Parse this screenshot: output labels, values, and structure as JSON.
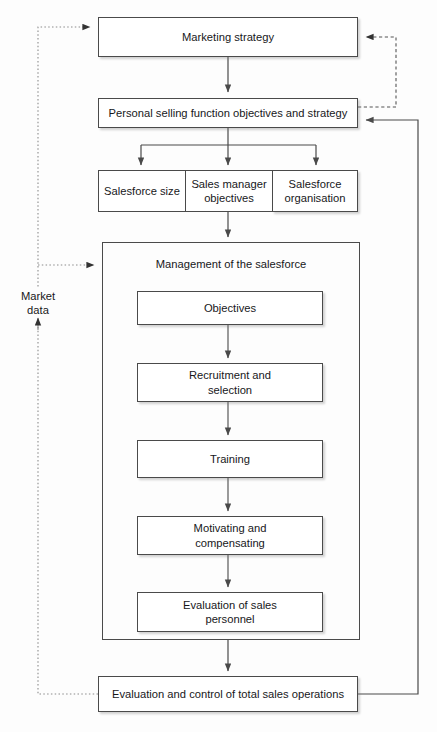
{
  "diagram": {
    "nodes": {
      "marketing_strategy": "Marketing strategy",
      "personal_selling": "Personal selling function objectives and strategy",
      "salesforce_size": "Salesforce size",
      "sales_manager_objectives": "Sales manager objectives",
      "salesforce_organisation": "Salesforce organisation",
      "management_container": "Management of the salesforce",
      "objectives": "Objectives",
      "recruitment": "Recruitment and selection",
      "training": "Training",
      "motivating": "Motivating and compensating",
      "evaluation_personnel": "Evaluation of sales personnel",
      "evaluation_total": "Evaluation and control of total sales operations"
    },
    "labels": {
      "market_data": "Market data"
    },
    "colors": {
      "box_border": "#4a4a4a",
      "box_fill": "#ffffff",
      "line": "#4a4a4a",
      "feedback_line": "#8a8a8a",
      "text": "#17171a",
      "background": "#fdfdfd"
    }
  }
}
